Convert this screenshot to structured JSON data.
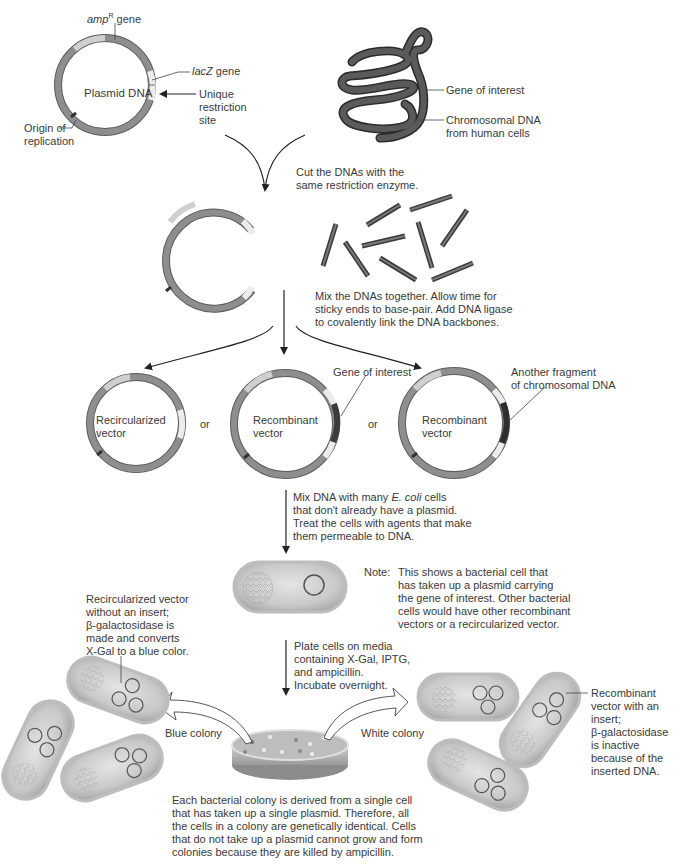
{
  "diagram": {
    "colors": {
      "plasmid_ring": "#8a8a8a",
      "plasmid_ring_dark": "#5c5c5c",
      "amp_segment": "#c8c8c8",
      "lacz_segment": "#e6e6e6",
      "insert_segment": "#4a4a4a",
      "chromosome": "#4f4f4f",
      "cell_fill": "#d4d4d4",
      "cell_border": "#b5b5b5",
      "arrow": "#222222",
      "text": "#3a3a3a"
    },
    "step1": {
      "plasmid_label": "Plasmid DNA",
      "amp_label_italic": "amp",
      "amp_label_sup": "R",
      "amp_label_rest": " gene",
      "lacz_label_italic": "lacZ",
      "lacz_label_rest": " gene",
      "restriction_site_line1": "Unique",
      "restriction_site_line2": "restriction",
      "restriction_site_line3": "site",
      "origin_line1": "Origin of",
      "origin_line2": "replication",
      "gene_of_interest": "Gene of interest",
      "chromosomal_line1": "Chromosomal DNA",
      "chromosomal_line2": "from human cells"
    },
    "step2": {
      "instruction_line1": "Cut the DNAs with the",
      "instruction_line2": "same restriction enzyme."
    },
    "step3": {
      "instruction_line1": "Mix the DNAs together. Allow time for",
      "instruction_line2": "sticky ends to base-pair. Add DNA ligase",
      "instruction_line3": "to covalently link the DNA backbones."
    },
    "step4": {
      "vector1_line1": "Recircularized",
      "vector1_line2": "vector",
      "or1": "or",
      "vector2_line1": "Recombinant",
      "vector2_line2": "vector",
      "or2": "or",
      "vector3_line1": "Recombinant",
      "vector3_line2": "vector",
      "gene_of_interest": "Gene of interest",
      "another_fragment_line1": "Another fragment",
      "another_fragment_line2": "of chromosomal DNA"
    },
    "step5": {
      "instruction_line1_pre": "Mix DNA with many ",
      "instruction_line1_italic": "E. coli",
      "instruction_line1_post": " cells",
      "instruction_line2": "that don't already have a plasmid.",
      "instruction_line3": "Treat the cells with agents that make",
      "instruction_line4": "them permeable to DNA.",
      "note_prefix": "Note:",
      "note_line1": "This shows a bacterial cell that",
      "note_line2": "has taken up a plasmid carrying",
      "note_line3": "the gene of interest. Other bacterial",
      "note_line4": "cells would have other recombinant",
      "note_line5": "vectors or a recircularized vector."
    },
    "step6": {
      "instruction_line1": "Plate cells on media",
      "instruction_line2": "containing X-Gal, IPTG,",
      "instruction_line3": "and ampicillin.",
      "instruction_line4": "Incubate overnight.",
      "blue_colony": "Blue colony",
      "white_colony": "White colony",
      "blue_desc_line1": "Recircularized vector",
      "blue_desc_line2": "without an insert;",
      "blue_desc_line3": "β-galactosidase is",
      "blue_desc_line4": "made and converts",
      "blue_desc_line5": "X-Gal to a blue color.",
      "white_desc_line1": "Recombinant",
      "white_desc_line2": "vector with an",
      "white_desc_line3": "insert;",
      "white_desc_line4": "β-galactosidase",
      "white_desc_line5": "is inactive",
      "white_desc_line6": "because of the",
      "white_desc_line7": "inserted DNA.",
      "footer_line1": "Each bacterial colony is derived from a single cell",
      "footer_line2": "that has taken up a single plasmid. Therefore, all",
      "footer_line3": "the cells in a colony are genetically identical. Cells",
      "footer_line4": "that do not take up a plasmid cannot grow and form",
      "footer_line5": "colonies because they are killed by ampicillin."
    }
  }
}
